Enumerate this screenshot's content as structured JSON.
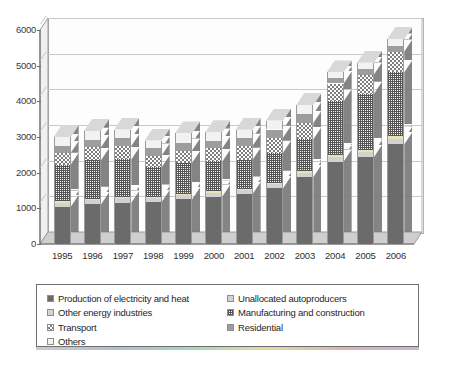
{
  "chart_data": {
    "type": "bar",
    "subtype": "stacked-column-3d",
    "title": "",
    "xlabel": "",
    "ylabel": "",
    "ylim": [
      0,
      6000
    ],
    "ytick_step": 1000,
    "yticks": [
      "0",
      "1000",
      "2000",
      "3000",
      "4000",
      "5000",
      "6000"
    ],
    "grid": true,
    "legend_position": "below",
    "categories": [
      "1995",
      "1996",
      "1997",
      "1998",
      "1999",
      "2000",
      "2001",
      "2002",
      "2003",
      "2004",
      "2005",
      "2006"
    ],
    "series": [
      {
        "name": "Production of electricity and heat",
        "color": "#6b6b6b",
        "pattern": "solid",
        "values": [
          1040,
          1110,
          1160,
          1180,
          1250,
          1330,
          1400,
          1560,
          1880,
          2310,
          2440,
          2800
        ]
      },
      {
        "name": "Unallocated autoproducers",
        "color": "#d2d2d2",
        "pattern": "solid-light",
        "values": [
          120,
          120,
          120,
          110,
          110,
          110,
          110,
          110,
          110,
          120,
          130,
          150
        ]
      },
      {
        "name": "Other energy industries",
        "color": "#e8e4b8",
        "pattern": "solid-pale",
        "values": [
          40,
          40,
          40,
          40,
          40,
          45,
          45,
          50,
          55,
          60,
          60,
          65
        ]
      },
      {
        "name": "Manufacturing and construction",
        "color": "#555555",
        "pattern": "grid-dots",
        "values": [
          1020,
          1080,
          1050,
          820,
          870,
          830,
          810,
          840,
          890,
          1510,
          1580,
          1800
        ]
      },
      {
        "name": "Transport",
        "color": "#7d7d7d",
        "pattern": "checkerboard",
        "values": [
          330,
          360,
          380,
          330,
          350,
          370,
          390,
          420,
          460,
          500,
          540,
          580
        ]
      },
      {
        "name": "Residential",
        "color": "#9d9d9d",
        "pattern": "solid-mid",
        "values": [
          200,
          210,
          210,
          200,
          210,
          215,
          220,
          230,
          250,
          150,
          160,
          170
        ]
      },
      {
        "name": "Others",
        "color": "#f2f2f2",
        "pattern": "solid-white",
        "values": [
          250,
          250,
          250,
          220,
          270,
          230,
          225,
          250,
          255,
          160,
          170,
          180
        ]
      }
    ],
    "totals": [
      3000,
      3170,
      3210,
      2900,
      3100,
      3130,
      3200,
      3460,
      3900,
      4810,
      5080,
      5745
    ]
  },
  "legend": {
    "left_column": [
      {
        "label": "Production of electricity and heat",
        "swatch": "s-prod"
      },
      {
        "label": "Other energy industries",
        "swatch": "s-unalloc"
      },
      {
        "label": "Transport",
        "swatch": "s-transp"
      },
      {
        "label": "Others",
        "swatch": "s-others"
      }
    ],
    "right_column": [
      {
        "label": "Unallocated autoproducers",
        "swatch": "s-unalloc"
      },
      {
        "label": "Manufacturing and construction",
        "swatch": "s-manu"
      },
      {
        "label": "Residential",
        "swatch": "s-resid"
      }
    ]
  }
}
